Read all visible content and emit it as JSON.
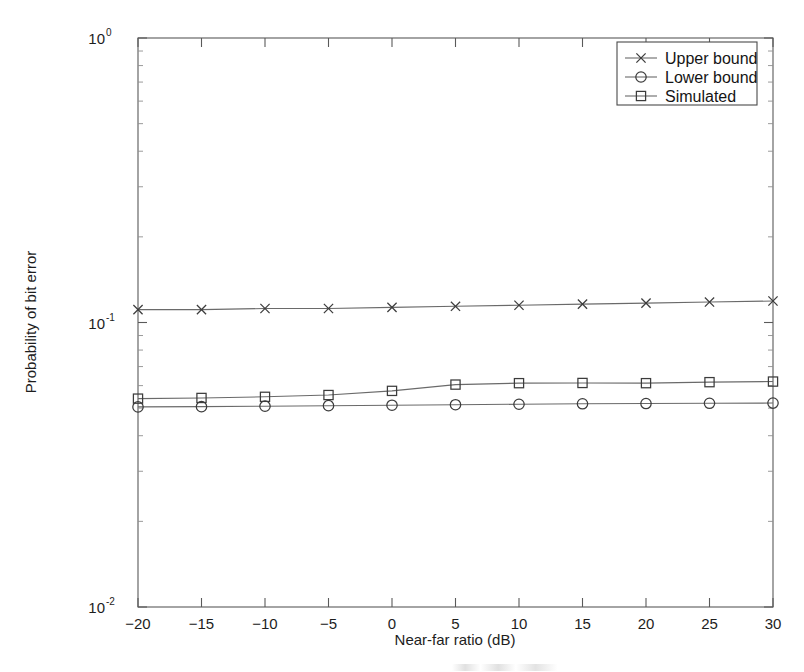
{
  "chart_data": {
    "type": "line",
    "title": "",
    "subtitle": "",
    "xlabel": "Near-far ratio (dB)",
    "ylabel": "Probability of bit error",
    "x": [
      -20,
      -15,
      -10,
      -5,
      0,
      5,
      10,
      15,
      20,
      25,
      30
    ],
    "xlim": [
      -20,
      30
    ],
    "ylim": [
      0.01,
      1
    ],
    "yscale": "log",
    "xticklabels": [
      "-20",
      "-15",
      "-10",
      "-5",
      "0",
      "5",
      "10",
      "15",
      "20",
      "25",
      "30"
    ],
    "yticklabels": [
      "10",
      "10",
      "10"
    ],
    "yticklabel_exponents": [
      "0",
      "-1",
      "-2"
    ],
    "yticks": [
      1,
      0.1,
      0.01
    ],
    "grid": false,
    "legend_position": "upper right",
    "series": [
      {
        "name": "Upper bound",
        "marker": "x",
        "values": [
          0.111,
          0.111,
          0.112,
          0.112,
          0.113,
          0.114,
          0.115,
          0.116,
          0.117,
          0.118,
          0.119
        ]
      },
      {
        "name": "Lower bound",
        "marker": "o",
        "values": [
          0.0505,
          0.0506,
          0.0508,
          0.051,
          0.0512,
          0.0514,
          0.0516,
          0.0518,
          0.0519,
          0.052,
          0.0521
        ]
      },
      {
        "name": "Simulated",
        "marker": "s",
        "values": [
          0.054,
          0.0543,
          0.0548,
          0.0556,
          0.0575,
          0.0605,
          0.0612,
          0.0613,
          0.0612,
          0.0617,
          0.062
        ]
      }
    ]
  },
  "legend": {
    "entries": [
      {
        "label": "Upper bound",
        "marker": "x"
      },
      {
        "label": "Lower bound",
        "marker": "o"
      },
      {
        "label": "Simulated",
        "marker": "s"
      }
    ]
  },
  "axes": {
    "x_title": "Near-far ratio (dB)",
    "y_title": "Probability of bit error"
  }
}
